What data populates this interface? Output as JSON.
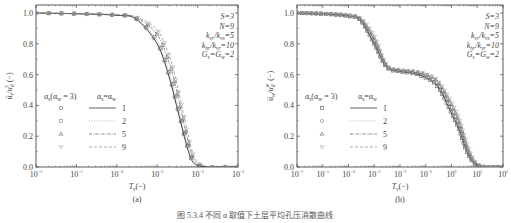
{
  "caption": "图 5.3.4  不同 α 取值下土层平均孔压消散曲线",
  "chart_data": [
    {
      "type": "line",
      "panel_label": "(a)",
      "xlabel": "T_v(−)",
      "ylabel": "ū_s/u_0^s (−)",
      "xscale": "log",
      "xlim": [
        1e-06,
        0.1
      ],
      "ylim": [
        0.0,
        1.0
      ],
      "x_ticks": [
        "10⁻⁶",
        "10⁻⁵",
        "10⁻⁴",
        "10⁻³",
        "10⁻²",
        "10⁻¹"
      ],
      "y_ticks": [
        "0.0",
        "0.2",
        "0.4",
        "0.6",
        "0.8",
        "1.0"
      ],
      "params": [
        "S=3",
        "N=9",
        "k_vr/k_vs=5",
        "k_hr/k_vr=10",
        "G_s=G_w=2"
      ],
      "legend": {
        "marker_header": "α_s(α_w = 3)",
        "line_header": "α_s=α_w",
        "values": [
          "1",
          "2",
          "5",
          "9"
        ],
        "markers": [
          "circle",
          "square",
          "triangle-up",
          "triangle-down"
        ],
        "line_styles": [
          "solid",
          "dotted",
          "dash-dot",
          "dashed"
        ]
      },
      "x": [
        1e-06,
        1e-05,
        0.0001,
        0.0003,
        0.001,
        0.002,
        0.003,
        0.005,
        0.007,
        0.01,
        0.02,
        0.05,
        0.1
      ],
      "series": [
        {
          "name": "1",
          "values": [
            1.0,
            0.995,
            0.985,
            0.96,
            0.8,
            0.58,
            0.4,
            0.17,
            0.05,
            0.01,
            0.0,
            0.0,
            0.0
          ]
        },
        {
          "name": "2",
          "values": [
            1.0,
            0.995,
            0.986,
            0.965,
            0.82,
            0.61,
            0.43,
            0.19,
            0.06,
            0.012,
            0.0,
            0.0,
            0.0
          ]
        },
        {
          "name": "5",
          "values": [
            1.0,
            0.996,
            0.988,
            0.97,
            0.86,
            0.67,
            0.5,
            0.24,
            0.09,
            0.02,
            0.0,
            0.0,
            0.0
          ]
        },
        {
          "name": "9",
          "values": [
            1.0,
            0.996,
            0.99,
            0.975,
            0.89,
            0.72,
            0.55,
            0.29,
            0.12,
            0.03,
            0.002,
            0.0,
            0.0
          ]
        }
      ]
    },
    {
      "type": "line",
      "panel_label": "(b)",
      "xlabel": "T_v(−)",
      "ylabel": "ū_w/u_0^w (−)",
      "xscale": "log",
      "xlim": [
        1e-06,
        100.0
      ],
      "ylim": [
        0.0,
        1.0
      ],
      "x_ticks": [
        "10⁻⁶",
        "10⁻⁵",
        "10⁻⁴",
        "10⁻³",
        "10⁻²",
        "10⁻¹",
        "10⁰",
        "10¹",
        "10²"
      ],
      "y_ticks": [
        "0.0",
        "0.2",
        "0.4",
        "0.6",
        "0.8",
        "1.0"
      ],
      "params": [
        "S=3",
        "N=9",
        "k_vr/k_vs=5",
        "k_hr/k_vr=10",
        "G_s=G_w=2"
      ],
      "legend": {
        "marker_header": "α_s(α_w = 3)",
        "line_header": "α_s=α_w",
        "values": [
          "1",
          "2",
          "5",
          "9"
        ],
        "markers": [
          "square",
          "circle",
          "triangle-up",
          "triangle-down"
        ],
        "line_styles": [
          "solid",
          "dotted",
          "dash-dot",
          "dashed"
        ]
      },
      "x": [
        1e-06,
        1e-05,
        0.0001,
        0.0003,
        0.001,
        0.003,
        0.01,
        0.03,
        0.1,
        0.3,
        1,
        2,
        4,
        8,
        20,
        100
      ],
      "series": [
        {
          "name": "1",
          "values": [
            1.0,
            0.995,
            0.98,
            0.95,
            0.8,
            0.65,
            0.62,
            0.61,
            0.58,
            0.52,
            0.35,
            0.24,
            0.1,
            0.02,
            0.0,
            0.0
          ]
        },
        {
          "name": "2",
          "values": [
            1.0,
            0.995,
            0.98,
            0.955,
            0.81,
            0.655,
            0.625,
            0.615,
            0.59,
            0.53,
            0.37,
            0.26,
            0.11,
            0.025,
            0.0,
            0.0
          ]
        },
        {
          "name": "5",
          "values": [
            1.0,
            0.996,
            0.985,
            0.96,
            0.83,
            0.66,
            0.63,
            0.62,
            0.6,
            0.55,
            0.4,
            0.29,
            0.13,
            0.03,
            0.0,
            0.0
          ]
        },
        {
          "name": "9",
          "values": [
            1.0,
            0.996,
            0.987,
            0.965,
            0.85,
            0.665,
            0.63,
            0.625,
            0.605,
            0.56,
            0.42,
            0.31,
            0.15,
            0.04,
            0.002,
            0.0
          ]
        }
      ]
    }
  ]
}
